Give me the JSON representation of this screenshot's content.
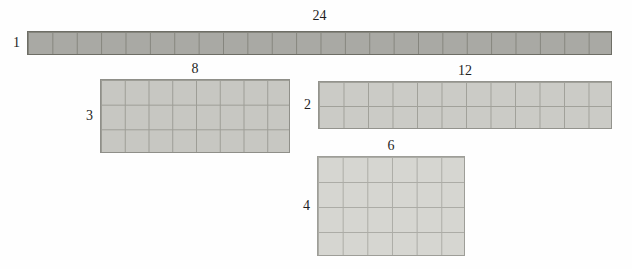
{
  "figure": {
    "arrays": [
      {
        "name": "array-1-by-24",
        "rows": 1,
        "cols": 24,
        "top_label": "24",
        "side_label": "1",
        "x": 27,
        "y": 31,
        "w": 585,
        "h": 24,
        "top_gap": 8,
        "fill": "#a9a9a4",
        "grid_line": "#85857d",
        "border": "#6e6e66"
      },
      {
        "name": "array-3-by-8",
        "rows": 3,
        "cols": 8,
        "top_label": "8",
        "side_label": "3",
        "x": 100,
        "y": 79,
        "w": 190,
        "h": 74,
        "top_gap": 3,
        "fill": "#c7c7c2",
        "grid_line": "#9d9d96",
        "border": "#8f8f89"
      },
      {
        "name": "array-2-by-12",
        "rows": 2,
        "cols": 12,
        "top_label": "12",
        "side_label": "2",
        "x": 318,
        "y": 81,
        "w": 294,
        "h": 48,
        "top_gap": 3,
        "fill": "#cbcbc6",
        "grid_line": "#a1a19a",
        "border": "#93938d"
      },
      {
        "name": "array-4-by-6",
        "rows": 4,
        "cols": 6,
        "top_label": "6",
        "side_label": "4",
        "x": 317,
        "y": 156,
        "w": 148,
        "h": 100,
        "top_gap": 3,
        "fill": "#d6d6d1",
        "grid_line": "#acaca6",
        "border": "#9e9e98"
      }
    ]
  }
}
